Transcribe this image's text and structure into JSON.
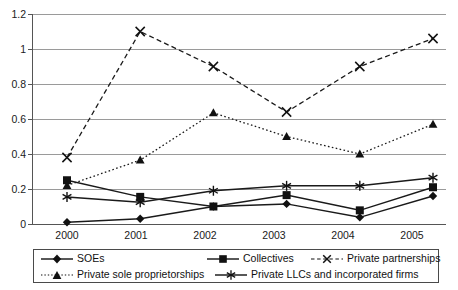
{
  "chart_data": {
    "type": "line",
    "title": "",
    "xlabel": "",
    "ylabel": "",
    "categories": [
      "2000",
      "2001",
      "2002",
      "2003",
      "2004",
      "2005"
    ],
    "ylim": [
      0,
      1.2
    ],
    "yticks": [
      "0",
      "0.2",
      "0.4",
      "0.6",
      "0.8",
      "1",
      "1.2"
    ],
    "ytick_values": [
      0,
      0.2,
      0.4,
      0.6,
      0.8,
      1.0,
      1.2
    ],
    "grid": true,
    "legend_position": "bottom",
    "series": [
      {
        "name": "SOEs",
        "marker": "diamond",
        "linestyle": "solid",
        "values": [
          0.01,
          0.03,
          0.1,
          0.115,
          0.038,
          0.16
        ]
      },
      {
        "name": "Collectives",
        "marker": "square",
        "linestyle": "solid",
        "values": [
          0.25,
          0.155,
          0.1,
          0.165,
          0.078,
          0.21
        ]
      },
      {
        "name": "Private partnerships",
        "marker": "x",
        "linestyle": "dashed",
        "values": [
          0.38,
          1.1,
          0.9,
          0.64,
          0.9,
          1.06
        ]
      },
      {
        "name": "Private sole proprietorships",
        "marker": "triangle",
        "linestyle": "dotted",
        "values": [
          0.22,
          0.365,
          0.635,
          0.5,
          0.4,
          0.57
        ]
      },
      {
        "name": "Private LLCs and incorporated firms",
        "marker": "asterisk",
        "linestyle": "solid",
        "values": [
          0.155,
          0.125,
          0.19,
          0.218,
          0.218,
          0.265
        ]
      }
    ]
  },
  "colors": {
    "series_line": "#1a1a1a",
    "gridline": "#9a9a9a",
    "axis": "#555555",
    "text": "#1a1a1a",
    "legend_border": "#4a4a4a",
    "background": "#ffffff"
  }
}
